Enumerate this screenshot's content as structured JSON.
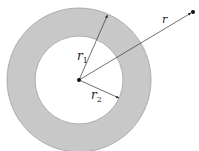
{
  "diagram": {
    "type": "annulus-radii",
    "colors": {
      "ring_fill": "#c8c8c8",
      "ring_stroke": "#9a9a9a",
      "inner_fill": "#ffffff",
      "line": "#333333",
      "point": "#111111"
    },
    "geometry": {
      "center": [
        79,
        80
      ],
      "outer_radius": 72,
      "inner_radius": 44,
      "r1_tip": [
        107,
        16
      ],
      "r2_tip": [
        119,
        98
      ],
      "r_end": [
        193,
        12
      ]
    },
    "labels": {
      "r": "r",
      "r1_base": "r",
      "r1_sub": "1",
      "r2_base": "r",
      "r2_sub": "2"
    }
  }
}
